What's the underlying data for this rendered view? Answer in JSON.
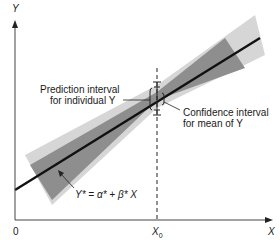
{
  "axes": {
    "y_label": "Y",
    "x_label": "X",
    "origin_label": "0",
    "x0_label": "X",
    "x0_subscript": "0"
  },
  "annotations": {
    "prediction_line1": "Prediction interval",
    "prediction_line2": "for individual Y",
    "confidence_line1": "Confidence interval",
    "confidence_line2": "for mean of Y",
    "equation": "Y* = α* + β* X"
  },
  "colors": {
    "prediction_band": "#d3d3d3",
    "confidence_band": "#8c8c8c",
    "regression_line": "#111111",
    "axis": "#333333"
  }
}
